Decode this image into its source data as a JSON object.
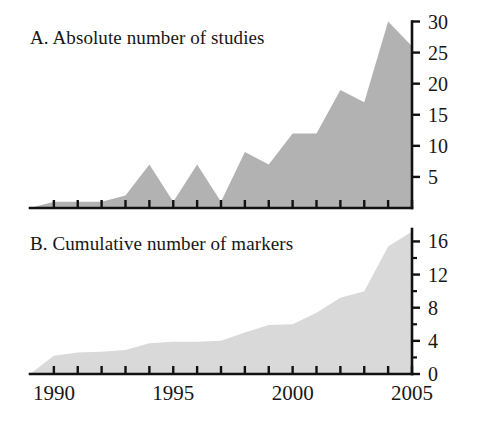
{
  "figure": {
    "background_color": "#ffffff",
    "width": 481,
    "height": 423
  },
  "panel_a": {
    "title": "A. Absolute number of studies",
    "fill_color": "#b2b2b2",
    "y_tick_labels": [
      "30",
      "25",
      "20",
      "15",
      "10",
      "5"
    ]
  },
  "panel_b": {
    "title": "B. Cumulative number of markers",
    "fill_color": "#d9d9d9",
    "y_tick_labels": [
      "16",
      "12",
      "8",
      "4",
      "0"
    ]
  },
  "x_axis": {
    "tick_labels": [
      "1990",
      "1995",
      "2000",
      "2005"
    ],
    "tick_values": [
      1990,
      1995,
      2000,
      2005
    ],
    "range": [
      1989,
      2005
    ]
  },
  "chart_data": [
    {
      "type": "area",
      "panel": "A",
      "title": "A. Absolute number of studies",
      "xlabel": "",
      "ylabel": "",
      "xlim": [
        1989,
        2005
      ],
      "ylim": [
        0,
        30
      ],
      "yticks": [
        5,
        10,
        15,
        20,
        25,
        30
      ],
      "xticks": [
        1990,
        1995,
        2000,
        2005
      ],
      "grid": false,
      "legend": "none",
      "fill_color": "#b2b2b2",
      "x": [
        1989,
        1990,
        1991,
        1992,
        1993,
        1994,
        1995,
        1996,
        1997,
        1998,
        1999,
        2000,
        2001,
        2002,
        2003,
        2004,
        2005
      ],
      "values": [
        0,
        1,
        1,
        1,
        2,
        7,
        1,
        7,
        1,
        9,
        7,
        12,
        12,
        19,
        17,
        30,
        26
      ]
    },
    {
      "type": "area",
      "panel": "B",
      "title": "B. Cumulative number of markers",
      "xlabel": "",
      "ylabel": "",
      "xlim": [
        1989,
        2005
      ],
      "ylim": [
        0,
        17.5
      ],
      "yticks": [
        0,
        4,
        8,
        12,
        16
      ],
      "xticks": [
        1990,
        1995,
        2000,
        2005
      ],
      "grid": false,
      "legend": "none",
      "fill_color": "#d9d9d9",
      "x": [
        1989,
        1990,
        1991,
        1992,
        1993,
        1994,
        1995,
        1996,
        1997,
        1998,
        1999,
        2000,
        2001,
        2002,
        2003,
        2004,
        2005
      ],
      "values": [
        0,
        2.2,
        2.6,
        2.7,
        2.9,
        3.7,
        3.9,
        3.9,
        4.0,
        5.0,
        5.9,
        6.0,
        7.4,
        9.2,
        10.0,
        15.4,
        17.2
      ]
    }
  ]
}
